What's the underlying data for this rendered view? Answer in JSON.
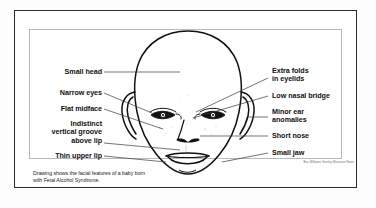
{
  "figure": {
    "caption": "Drawing shows the facial features of a baby born\nwith Fetal Alcohol Syndrome.",
    "credit": "Box Williams Stanley Mountain News",
    "colors": {
      "ink": "#111111",
      "frame": "#2b2b2b",
      "inner_frame": "#b9b9b9",
      "background": "#ffffff",
      "leader_line": "#3a3a3a"
    }
  },
  "labels_left": [
    {
      "id": "small-head",
      "text": "Small head"
    },
    {
      "id": "narrow-eyes",
      "text": "Narrow eyes"
    },
    {
      "id": "flat-midface",
      "text": "Flat midface"
    },
    {
      "id": "indistinct-vertical-groove-above-lip",
      "text": "Indistinct\nvertical groove\nabove lip"
    },
    {
      "id": "thin-upper-lip",
      "text": "Thin upper lip"
    }
  ],
  "labels_right": [
    {
      "id": "extra-folds-in-eyelids",
      "text": "Extra folds\nin eyelids"
    },
    {
      "id": "low-nasal-bridge",
      "text": "Low nasal bridge"
    },
    {
      "id": "minor-ear-anomalies",
      "text": "Minor ear\nanomalies"
    },
    {
      "id": "short-nose",
      "text": "Short nose"
    },
    {
      "id": "small-jaw",
      "text": "Small jaw"
    }
  ]
}
